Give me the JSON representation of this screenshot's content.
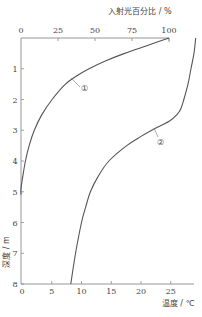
{
  "chart_data": {
    "type": "line",
    "title": "",
    "orientation": "depth-vertical (depth increases downward)",
    "y_axis": {
      "label": "深度 / m",
      "range": [
        0,
        8
      ],
      "inverted": true,
      "ticks": [
        0,
        1,
        2,
        3,
        4,
        5,
        6,
        7,
        8
      ]
    },
    "top_axis": {
      "label": "入射光百分比 / %",
      "range": [
        0,
        100
      ],
      "ticks": [
        0,
        25,
        50,
        75,
        100
      ]
    },
    "bottom_axis": {
      "label": "温度 / ℃",
      "range": [
        0,
        29
      ],
      "ticks": [
        0,
        5,
        10,
        15,
        20,
        25
      ]
    },
    "series": [
      {
        "name": "①",
        "description": "入射光百分比 vs 深度 (top axis)",
        "axis": "top",
        "depth": [
          0,
          0.25,
          0.5,
          0.75,
          1,
          1.25,
          1.5,
          2,
          2.5,
          3,
          3.5,
          4,
          4.5,
          4.9
        ],
        "values": [
          100,
          85,
          70,
          57,
          46,
          37,
          30,
          21,
          14,
          9,
          5.5,
          3,
          1.2,
          0
        ]
      },
      {
        "name": "②",
        "description": "温度 vs 深度 (bottom axis)",
        "axis": "bottom",
        "depth": [
          0,
          0.5,
          1,
          1.5,
          2,
          2.3,
          2.5,
          2.7,
          2.85,
          3,
          3.2,
          3.5,
          4,
          4.5,
          5,
          5.5,
          6,
          7,
          8
        ],
        "values": [
          29.2,
          28.9,
          28.4,
          27.9,
          27.2,
          26.7,
          26.0,
          24.8,
          23.3,
          21.8,
          20.0,
          17.6,
          14.6,
          12.8,
          11.5,
          10.7,
          10.0,
          9.0,
          8.2
        ]
      }
    ],
    "annotations": [
      {
        "text": "①",
        "near_series": "①",
        "approx_depth": 1.1,
        "approx_percent": 42
      },
      {
        "text": "②",
        "near_series": "②",
        "approx_depth": 3.1,
        "approx_temp": 23.5
      }
    ],
    "grid": false,
    "legend": "none (inline circled-number labels)"
  },
  "labels": {
    "top_axis_title": "入射光百分比 / %",
    "bottom_axis_title": "温度 / ℃",
    "y_axis_title": "深度 / m",
    "curve1": "①",
    "curve2": "②",
    "top_ticks": [
      "0",
      "25",
      "50",
      "75",
      "100"
    ],
    "bottom_ticks": [
      "0",
      "5",
      "10",
      "15",
      "20",
      "25"
    ],
    "y_ticks": [
      "1",
      "2",
      "3",
      "4",
      "5",
      "6",
      "7",
      "8"
    ]
  },
  "colors": {
    "axis": "#8a8a8a",
    "curve": "#555555",
    "text": "#444444"
  }
}
